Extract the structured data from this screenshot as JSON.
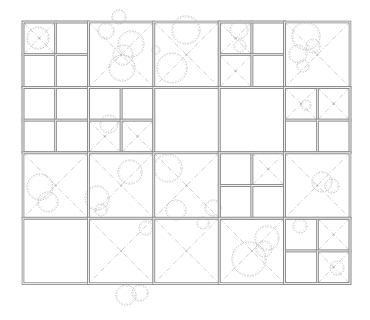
{
  "diagram": {
    "type": "quadtree-site-plan",
    "colors": {
      "line": "#8a8a8a",
      "line_inner": "#ffffff",
      "diagonal": "#c4c4c4",
      "circle": "#b0b0b0"
    },
    "origin": [
      23,
      22
    ],
    "cell": 65.4,
    "cols": 5,
    "rows": 4,
    "cells": [
      {
        "r": 0,
        "c": 0,
        "split": true,
        "x": false,
        "quads": [
          true,
          false,
          false,
          false
        ]
      },
      {
        "r": 0,
        "c": 1,
        "split": false,
        "x": true
      },
      {
        "r": 0,
        "c": 2,
        "split": false,
        "x": true
      },
      {
        "r": 0,
        "c": 3,
        "split": true,
        "x": false,
        "quads": [
          true,
          false,
          true,
          false
        ]
      },
      {
        "r": 0,
        "c": 4,
        "split": false,
        "x": true
      },
      {
        "r": 1,
        "c": 0,
        "split": true,
        "x": false,
        "quads": [
          false,
          false,
          false,
          false
        ]
      },
      {
        "r": 1,
        "c": 1,
        "split": true,
        "x": false,
        "quads": [
          false,
          false,
          true,
          true
        ]
      },
      {
        "r": 1,
        "c": 2,
        "split": false,
        "x": false
      },
      {
        "r": 1,
        "c": 3,
        "split": false,
        "x": false
      },
      {
        "r": 1,
        "c": 4,
        "split": true,
        "x": false,
        "quads": [
          true,
          true,
          false,
          false
        ]
      },
      {
        "r": 2,
        "c": 0,
        "split": false,
        "x": true
      },
      {
        "r": 2,
        "c": 1,
        "split": false,
        "x": true
      },
      {
        "r": 2,
        "c": 2,
        "split": false,
        "x": true
      },
      {
        "r": 2,
        "c": 3,
        "split": true,
        "x": false,
        "quads": [
          false,
          true,
          false,
          false
        ]
      },
      {
        "r": 2,
        "c": 4,
        "split": false,
        "x": true
      },
      {
        "r": 3,
        "c": 0,
        "split": false,
        "x": false
      },
      {
        "r": 3,
        "c": 1,
        "split": false,
        "x": true
      },
      {
        "r": 3,
        "c": 2,
        "split": false,
        "x": true
      },
      {
        "r": 3,
        "c": 3,
        "split": false,
        "x": true
      },
      {
        "r": 3,
        "c": 4,
        "split": true,
        "x": false,
        "quads": [
          false,
          true,
          false,
          true
        ]
      }
    ],
    "circles": [
      [
        38,
        38,
        11
      ],
      [
        119,
        17,
        7
      ],
      [
        106,
        31,
        8
      ],
      [
        131,
        44,
        13
      ],
      [
        123,
        55,
        10
      ],
      [
        122,
        68,
        13
      ],
      [
        186,
        30,
        14
      ],
      [
        172,
        68,
        15
      ],
      [
        156,
        50,
        4
      ],
      [
        239,
        30,
        9
      ],
      [
        240,
        46,
        6
      ],
      [
        306,
        36,
        14
      ],
      [
        298,
        54,
        9
      ],
      [
        303,
        66,
        6
      ],
      [
        313,
        46,
        7
      ],
      [
        109,
        124,
        9
      ],
      [
        306,
        105,
        5
      ],
      [
        40,
        187,
        13
      ],
      [
        48,
        202,
        10
      ],
      [
        97,
        198,
        12
      ],
      [
        101,
        210,
        6
      ],
      [
        130,
        172,
        12
      ],
      [
        168,
        168,
        14
      ],
      [
        176,
        210,
        10
      ],
      [
        213,
        208,
        8
      ],
      [
        322,
        182,
        10
      ],
      [
        332,
        186,
        7
      ],
      [
        146,
        228,
        7
      ],
      [
        203,
        223,
        6
      ],
      [
        267,
        238,
        12
      ],
      [
        249,
        259,
        17
      ],
      [
        264,
        249,
        8
      ],
      [
        337,
        268,
        7
      ],
      [
        300,
        226,
        7
      ],
      [
        126,
        295,
        10
      ],
      [
        140,
        293,
        8
      ]
    ]
  }
}
